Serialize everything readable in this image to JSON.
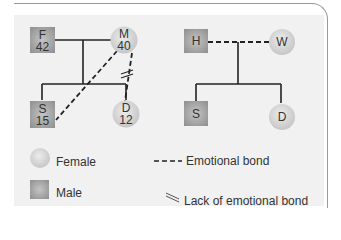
{
  "colors": {
    "panel_bg": "#f1f1f1",
    "frame": "#9a9a9a",
    "line": "#222222",
    "male_fill": "#a6a6a6",
    "female_fill": "#d8d8d8",
    "text": "#333333"
  },
  "left_family": {
    "father": {
      "symbol": "square",
      "label": "F",
      "age": "42"
    },
    "mother": {
      "symbol": "circle",
      "label": "M",
      "age": "40"
    },
    "son": {
      "symbol": "square",
      "label": "S",
      "age": "15"
    },
    "daughter": {
      "symbol": "circle",
      "label": "D",
      "age": "12"
    },
    "relationships": [
      {
        "from": "F",
        "to": "M",
        "type": "marriage"
      },
      {
        "from": "M",
        "to": "S",
        "type": "emotional-bond"
      },
      {
        "from": "M",
        "to": "D",
        "type": "lack-of-emotional-bond"
      }
    ]
  },
  "right_family": {
    "husband": {
      "symbol": "square",
      "label": "H"
    },
    "wife": {
      "symbol": "circle",
      "label": "W"
    },
    "son": {
      "symbol": "square",
      "label": "S"
    },
    "daughter": {
      "symbol": "circle",
      "label": "D"
    },
    "relationships": [
      {
        "from": "H",
        "to": "W",
        "type": "emotional-bond"
      }
    ]
  },
  "legend": {
    "female": "Female",
    "male": "Male",
    "emotional_bond": "Emotional bond",
    "lack_of_bond": "Lack of emotional bond"
  }
}
